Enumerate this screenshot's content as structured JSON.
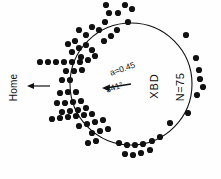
{
  "figure": {
    "type": "circular-orientation-diagram",
    "background": "#ffffff",
    "ink_color": "#111111"
  },
  "labels": {
    "home": "Home",
    "group": "XBD",
    "sample_size": "N=75",
    "vector_length": "a=0.45",
    "mean_angle": "341°"
  },
  "chart_data": {
    "type": "scatter",
    "title": "",
    "subtitle": "",
    "xlabel": "",
    "ylabel": "",
    "grid": false,
    "legend_position": "none",
    "coordinate_system": "polar",
    "angle_units": "degrees",
    "angle_zero_direction": "up",
    "angle_direction": "clockwise",
    "circle": {
      "cx": 131,
      "cy": 84,
      "r": 61,
      "stroke_width": 1.1
    },
    "home_direction_deg": 270,
    "mean_vector": {
      "length_a": 0.45,
      "angle_deg": 341,
      "drawn_from": [
        131,
        84
      ],
      "drawn_to": [
        104,
        88
      ],
      "arrowhead": "at-tip"
    },
    "n_points": 75,
    "dot_radius_px": 3.1,
    "points_px": [
      [
        106,
        5
      ],
      [
        109,
        13
      ],
      [
        105,
        22
      ],
      [
        118,
        13
      ],
      [
        125,
        5
      ],
      [
        128,
        22
      ],
      [
        99,
        30
      ],
      [
        92,
        27
      ],
      [
        86,
        35
      ],
      [
        79,
        30
      ],
      [
        132,
        9
      ],
      [
        117,
        30
      ],
      [
        111,
        36
      ],
      [
        104,
        41
      ],
      [
        75,
        41
      ],
      [
        68,
        44
      ],
      [
        72,
        52
      ],
      [
        79,
        48
      ],
      [
        86,
        45
      ],
      [
        92,
        50
      ],
      [
        81,
        57
      ],
      [
        88,
        60
      ],
      [
        95,
        56
      ],
      [
        40,
        62
      ],
      [
        48,
        62
      ],
      [
        56,
        62
      ],
      [
        64,
        62
      ],
      [
        72,
        62
      ],
      [
        80,
        62
      ],
      [
        66,
        71
      ],
      [
        74,
        71
      ],
      [
        82,
        70
      ],
      [
        62,
        80
      ],
      [
        70,
        80
      ],
      [
        60,
        93
      ],
      [
        68,
        92
      ],
      [
        76,
        92
      ],
      [
        57,
        103
      ],
      [
        65,
        103
      ],
      [
        73,
        102
      ],
      [
        81,
        101
      ],
      [
        62,
        112
      ],
      [
        70,
        111
      ],
      [
        78,
        110
      ],
      [
        86,
        108
      ],
      [
        52,
        119
      ],
      [
        60,
        118
      ],
      [
        68,
        117
      ],
      [
        76,
        116
      ],
      [
        84,
        115
      ],
      [
        92,
        114
      ],
      [
        79,
        126
      ],
      [
        87,
        124
      ],
      [
        95,
        122
      ],
      [
        103,
        120
      ],
      [
        92,
        133
      ],
      [
        100,
        131
      ],
      [
        108,
        129
      ],
      [
        88,
        143
      ],
      [
        96,
        141
      ],
      [
        119,
        143
      ],
      [
        127,
        145
      ],
      [
        135,
        145
      ],
      [
        143,
        144
      ],
      [
        125,
        154
      ],
      [
        133,
        155
      ],
      [
        141,
        153
      ],
      [
        150,
        150
      ],
      [
        152,
        141
      ],
      [
        160,
        137
      ],
      [
        170,
        123
      ],
      [
        186,
        35
      ],
      [
        196,
        58
      ],
      [
        199,
        70
      ],
      [
        200,
        79
      ],
      [
        203,
        87
      ],
      [
        197,
        95
      ],
      [
        188,
        113
      ]
    ]
  }
}
